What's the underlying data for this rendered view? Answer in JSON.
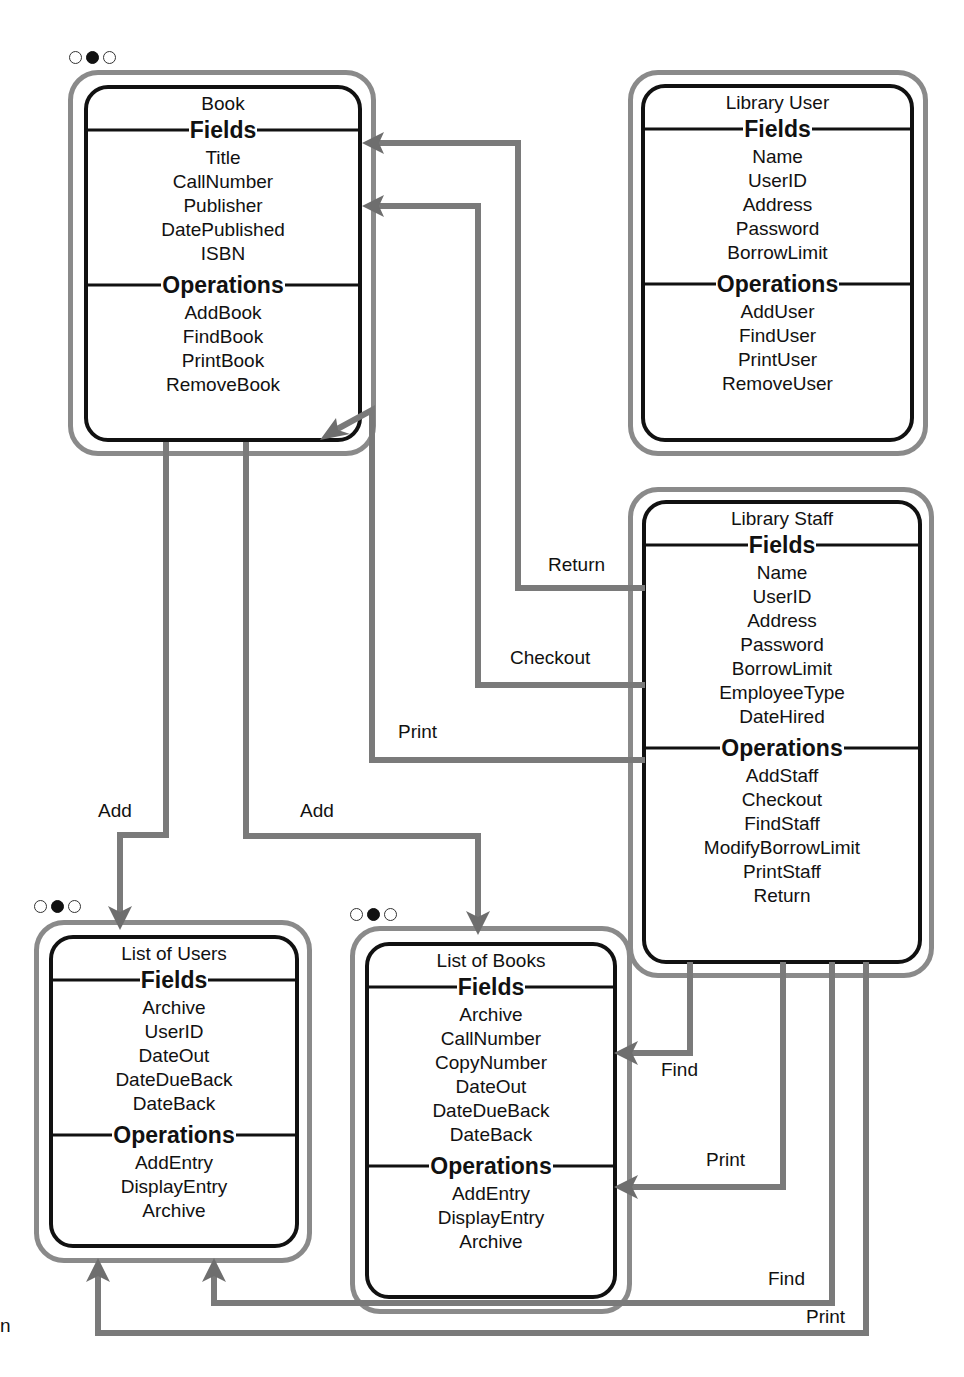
{
  "classes": {
    "book": {
      "title": "Book",
      "fields_label": "Fields",
      "fields": [
        "Title",
        "CallNumber",
        "Publisher",
        "DatePublished",
        "ISBN"
      ],
      "operations_label": "Operations",
      "operations": [
        "AddBook",
        "FindBook",
        "PrintBook",
        "RemoveBook"
      ]
    },
    "library_user": {
      "title": "Library User",
      "fields_label": "Fields",
      "fields": [
        "Name",
        "UserID",
        "Address",
        "Password",
        "BorrowLimit"
      ],
      "operations_label": "Operations",
      "operations": [
        "AddUser",
        "FindUser",
        "PrintUser",
        "RemoveUser"
      ]
    },
    "library_staff": {
      "title": "Library Staff",
      "fields_label": "Fields",
      "fields": [
        "Name",
        "UserID",
        "Address",
        "Password",
        "BorrowLimit",
        "EmployeeType",
        "DateHired"
      ],
      "operations_label": "Operations",
      "operations": [
        "AddStaff",
        "Checkout",
        "FindStaff",
        "ModifyBorrowLimit",
        "PrintStaff",
        "Return"
      ]
    },
    "list_of_users": {
      "title": "List of Users",
      "fields_label": "Fields",
      "fields": [
        "Archive",
        "UserID",
        "DateOut",
        "DateDueBack",
        "DateBack"
      ],
      "operations_label": "Operations",
      "operations": [
        "AddEntry",
        "DisplayEntry",
        "Archive"
      ]
    },
    "list_of_books": {
      "title": "List of Books",
      "fields_label": "Fields",
      "fields": [
        "Archive",
        "CallNumber",
        "CopyNumber",
        "DateOut",
        "DateDueBack",
        "DateBack"
      ],
      "operations_label": "Operations",
      "operations": [
        "AddEntry",
        "DisplayEntry",
        "Archive"
      ]
    }
  },
  "connections": {
    "return": "Return",
    "checkout": "Checkout",
    "print_book": "Print",
    "add_users": "Add",
    "add_books": "Add",
    "find_list_books": "Find",
    "print_list_books": "Print",
    "find_list_users": "Find",
    "print_list_users": "Print"
  },
  "page_fragment": "n",
  "colors": {
    "connector": "#7a7a7a",
    "box_border": "#111111",
    "outer_border": "#8a8a8a"
  }
}
